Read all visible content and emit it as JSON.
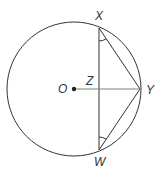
{
  "diagram": {
    "type": "circle-geometry",
    "colors": {
      "stroke": "#333333",
      "radius_line": "#6f8a6a",
      "background": "#ffffff"
    },
    "circle": {
      "center_label": "O",
      "cx": 74,
      "cy": 89,
      "r": 67
    },
    "points": {
      "X": {
        "label": "X",
        "x": 99,
        "y": 28
      },
      "W": {
        "label": "W",
        "x": 99,
        "y": 150
      },
      "Y": {
        "label": "Y",
        "x": 140,
        "y": 89
      },
      "Z": {
        "label": "Z",
        "x": 99,
        "y": 89
      },
      "O": {
        "label": "O",
        "x": 74,
        "y": 89
      }
    },
    "segments": [
      "XW",
      "XY",
      "WY",
      "OY"
    ],
    "angle_marks": [
      "angle at X (WXY)",
      "angle at W (XWY)"
    ],
    "labels": {
      "X": "X",
      "W": "W",
      "Y": "Y",
      "Z": "Z",
      "O": "O"
    }
  }
}
